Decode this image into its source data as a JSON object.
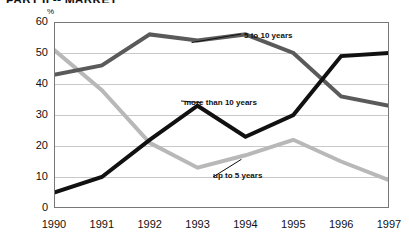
{
  "title": "PART II -- MARKET",
  "axes": {
    "unit_label": "%",
    "y_ticks": [
      "60",
      "50",
      "40",
      "30",
      "20",
      "10",
      "0"
    ],
    "x_ticks": [
      "1990",
      "1991",
      "1992",
      "1993",
      "1994",
      "1995",
      "1996",
      "1997"
    ]
  },
  "labels": {
    "five_to_ten": "5 to 10 years",
    "more_than_ten": "more than 10 years",
    "up_to_five": "up to 5 years"
  },
  "colors": {
    "five_to_ten": "#5a5a5a",
    "more_than_ten": "#111111",
    "up_to_five": "#b8b8b8",
    "grid": "#c9c9c9",
    "axis": "#555555"
  },
  "chart_data": {
    "type": "line",
    "title": "PART II -- MARKET",
    "xlabel": "",
    "ylabel": "%",
    "ylim": [
      0,
      60
    ],
    "grid": true,
    "legend": "inline-annotations",
    "categories": [
      "1990",
      "1991",
      "1992",
      "1993",
      "1994",
      "1995",
      "1996",
      "1997"
    ],
    "series": [
      {
        "name": "5 to 10 years",
        "color": "#5a5a5a",
        "values": [
          43,
          46,
          56,
          54,
          56,
          50,
          36,
          33
        ]
      },
      {
        "name": "more than 10 years",
        "color": "#111111",
        "values": [
          5,
          10,
          22,
          33,
          23,
          30,
          49,
          50
        ]
      },
      {
        "name": "up to 5 years",
        "color": "#b8b8b8",
        "values": [
          51,
          38,
          21,
          13,
          17,
          22,
          15,
          9
        ]
      }
    ]
  }
}
